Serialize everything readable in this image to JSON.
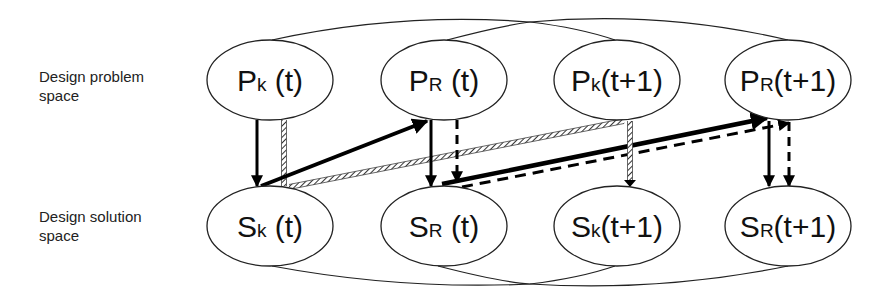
{
  "row_labels": {
    "problem": [
      "Design problem",
      "space"
    ],
    "solution": [
      "Design solution",
      "space"
    ]
  },
  "nodes": {
    "problem": [
      {
        "main": "P",
        "sub": "k",
        "time": " (t)"
      },
      {
        "main": "P",
        "sub": "R",
        "time": " (t)"
      },
      {
        "main": "P",
        "sub": "k",
        "time": "(t+1)"
      },
      {
        "main": "P",
        "sub": "R",
        "time": "(t+1)"
      }
    ],
    "solution": [
      {
        "main": "S",
        "sub": "k",
        "time": " (t)"
      },
      {
        "main": "S",
        "sub": "R",
        "time": " (t)"
      },
      {
        "main": "S",
        "sub": "k",
        "time": "(t+1)"
      },
      {
        "main": "S",
        "sub": "R",
        "time": "(t+1)"
      }
    ]
  },
  "edges": [
    {
      "from": "Pk(t)",
      "to": "Sk(t)",
      "style": "solid"
    },
    {
      "from": "Pk(t)",
      "to": "Sk(t)",
      "style": "hatched"
    },
    {
      "from": "Sk(t)",
      "to": "PR(t)",
      "style": "solid"
    },
    {
      "from": "Sk(t)",
      "to": "Pk(t+1)",
      "style": "hatched"
    },
    {
      "from": "PR(t)",
      "to": "SR(t)",
      "style": "solid"
    },
    {
      "from": "PR(t)",
      "to": "SR(t)",
      "style": "dashed"
    },
    {
      "from": "SR(t)",
      "to": "PR(t+1)",
      "style": "solid"
    },
    {
      "from": "SR(t)",
      "to": "PR(t+1)",
      "style": "dashed"
    },
    {
      "from": "Pk(t+1)",
      "to": "Sk(t+1)",
      "style": "hatched"
    },
    {
      "from": "PR(t+1)",
      "to": "SR(t+1)",
      "style": "solid"
    },
    {
      "from": "PR(t+1)",
      "to": "SR(t+1)",
      "style": "dashed"
    }
  ]
}
